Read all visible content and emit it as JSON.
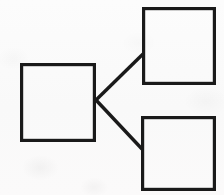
{
  "diagram": {
    "title": "",
    "background_color": "#fafafa",
    "stroke_color": "#1a1a1a",
    "canvas": {
      "width": 224,
      "height": 195
    },
    "nodes": [
      {
        "id": "source",
        "name": "left-box",
        "label": "",
        "x": 20,
        "y": 63,
        "width": 76,
        "height": 79,
        "stroke_width": 3.2,
        "fill": "none"
      },
      {
        "id": "target-upper",
        "name": "top-right-box",
        "label": "",
        "x": 142,
        "y": 7,
        "width": 74,
        "height": 78,
        "stroke_width": 3.2,
        "fill": "none"
      },
      {
        "id": "target-lower",
        "name": "bottom-right-box",
        "label": "",
        "x": 141,
        "y": 116,
        "width": 75,
        "height": 75,
        "stroke_width": 3.2,
        "fill": "none"
      }
    ],
    "edges": [
      {
        "id": "edge-upper",
        "name": "connector-left-to-top-right",
        "from": "source",
        "to": "target-upper",
        "label": "",
        "x1": 96,
        "y1": 100,
        "x2": 143,
        "y2": 54,
        "stroke_width": 3.4
      },
      {
        "id": "edge-lower",
        "name": "connector-left-to-bottom-right",
        "from": "source",
        "to": "target-lower",
        "label": "",
        "x1": 96,
        "y1": 100,
        "x2": 142,
        "y2": 149,
        "stroke_width": 3.4
      }
    ]
  }
}
